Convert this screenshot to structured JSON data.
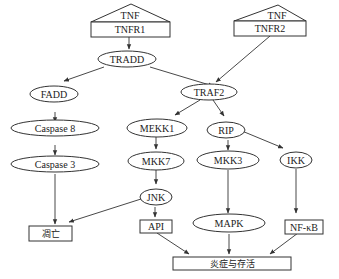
{
  "diagram": {
    "type": "signaling-pathway",
    "nodes": {
      "tnf1": {
        "label": "TNF",
        "shape": "triangle"
      },
      "tnfr1": {
        "label": "TNFR1",
        "shape": "box"
      },
      "tnf2": {
        "label": "TNF",
        "shape": "triangle"
      },
      "tnfr2": {
        "label": "TNFR2",
        "shape": "box"
      },
      "tradd": {
        "label": "TRADD",
        "shape": "ellipse"
      },
      "traf2": {
        "label": "TRAF2",
        "shape": "ellipse"
      },
      "fadd": {
        "label": "FADD",
        "shape": "ellipse"
      },
      "caspase8": {
        "label": "Caspase 8",
        "shape": "ellipse"
      },
      "caspase3": {
        "label": "Caspase 3",
        "shape": "ellipse"
      },
      "mekk1": {
        "label": "MEKK1",
        "shape": "ellipse"
      },
      "mkk7": {
        "label": "MKK7",
        "shape": "ellipse"
      },
      "jnk": {
        "label": "JNK",
        "shape": "ellipse"
      },
      "rip": {
        "label": "RIP",
        "shape": "ellipse"
      },
      "mkk3": {
        "label": "MKK3",
        "shape": "ellipse"
      },
      "ikk": {
        "label": "IKK",
        "shape": "ellipse"
      },
      "mapk": {
        "label": "MAPK",
        "shape": "ellipse"
      },
      "apoptosis": {
        "label": "凋亡",
        "shape": "box"
      },
      "api": {
        "label": "API",
        "shape": "box"
      },
      "nfkb": {
        "label": "NF-κB",
        "shape": "box"
      },
      "inflammation": {
        "label": "炎症与存活",
        "shape": "box"
      }
    },
    "edges": [
      {
        "from": "TNFR1",
        "to": "TRADD"
      },
      {
        "from": "TRADD",
        "to": "FADD"
      },
      {
        "from": "TRADD",
        "to": "TRAF2"
      },
      {
        "from": "TNFR2",
        "to": "TRAF2"
      },
      {
        "from": "FADD",
        "to": "Caspase 8"
      },
      {
        "from": "Caspase 8",
        "to": "Caspase 3"
      },
      {
        "from": "Caspase 3",
        "to": "凋亡"
      },
      {
        "from": "TRAF2",
        "to": "MEKK1"
      },
      {
        "from": "TRAF2",
        "to": "RIP"
      },
      {
        "from": "MEKK1",
        "to": "MKK7"
      },
      {
        "from": "MKK7",
        "to": "JNK"
      },
      {
        "from": "JNK",
        "to": "凋亡"
      },
      {
        "from": "JNK",
        "to": "API"
      },
      {
        "from": "RIP",
        "to": "MKK3"
      },
      {
        "from": "RIP",
        "to": "IKK"
      },
      {
        "from": "MKK3",
        "to": "MAPK"
      },
      {
        "from": "IKK",
        "to": "NF-κB"
      },
      {
        "from": "API",
        "to": "炎症与存活"
      },
      {
        "from": "MAPK",
        "to": "炎症与存活"
      },
      {
        "from": "NF-κB",
        "to": "炎症与存活"
      }
    ]
  }
}
